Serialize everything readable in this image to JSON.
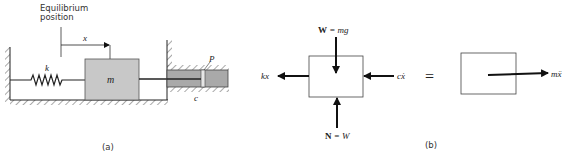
{
  "panel_a": {
    "equilibrium_label_line1": "Equilibrium",
    "equilibrium_label_line2": "position",
    "displacement_label": "x",
    "spring_label": "k",
    "mass_label": "m",
    "piston_label": "P",
    "damper_label": "c",
    "caption": "(a)"
  },
  "panel_b": {
    "weight_bold": "W",
    "weight_rest": " = mg",
    "normal_bold": "N",
    "normal_rest": " = W",
    "spring_force_label": "kx",
    "damper_force_label": "cẋ",
    "equals_sign": "=",
    "inertia_label": "mẍ",
    "caption": "(b)"
  },
  "colors": {
    "mass_fill": "#c8c8c8",
    "cylinder_fill": "#a9a9a9",
    "line": "#1a1a1a"
  }
}
